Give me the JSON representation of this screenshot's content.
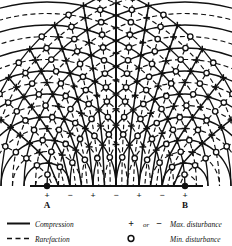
{
  "figure": {
    "sources": [
      {
        "label": "A",
        "x": 47,
        "y": 186,
        "sign": "+"
      },
      {
        "label": "B",
        "x": 185,
        "y": 186,
        "sign": "+"
      }
    ],
    "baseline": {
      "y": 186,
      "x_start": 30,
      "x_end": 203,
      "markers": [
        {
          "sign": "+",
          "x": 47,
          "label": "A"
        },
        {
          "sign": "−",
          "x": 70,
          "label": ""
        },
        {
          "sign": "+",
          "x": 93,
          "label": ""
        },
        {
          "sign": "−",
          "x": 116,
          "label": ""
        },
        {
          "sign": "+",
          "x": 139,
          "label": ""
        },
        {
          "sign": "−",
          "x": 162,
          "label": ""
        },
        {
          "sign": "+",
          "x": 185,
          "label": "B"
        }
      ]
    },
    "wavefronts": {
      "compression_style": "solid",
      "rarefaction_style": "dashed",
      "radii_solid": [
        23,
        46,
        69,
        92,
        115,
        138,
        161,
        184,
        207
      ],
      "radii_dashed": [
        11.5,
        34.5,
        57.5,
        80.5,
        103.5,
        126.5,
        149.5,
        172.5,
        195.5
      ],
      "wavelength": 23
    },
    "nodal_lines": {
      "description": "hyperbolic loci of max and min disturbance",
      "count": 7
    },
    "markers": {
      "max_symbol": "+",
      "min_symbol": "○"
    }
  },
  "legend": {
    "items": [
      {
        "id": "compression",
        "symbol": "line-solid",
        "label": "Compression"
      },
      {
        "id": "rarefaction",
        "symbol": "line-dashed",
        "label": "Rarefaction"
      },
      {
        "id": "max-disturbance",
        "symbol_plus": "+",
        "connector": "or",
        "symbol_minus": "−",
        "label": "Max. disturbance"
      },
      {
        "id": "min-disturbance",
        "symbol_circle": "○",
        "label": "Min. disturbance"
      }
    ]
  },
  "colors": {
    "ink": "#111111",
    "background": "#ffffff"
  }
}
